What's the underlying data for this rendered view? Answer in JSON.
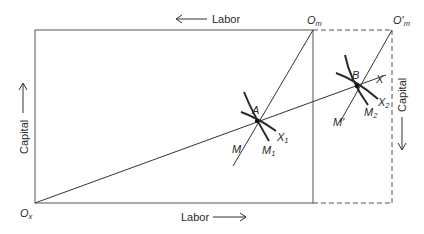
{
  "figure": {
    "type": "Edgeworth box diagram (factor allocation, expanded box)",
    "colors": {
      "line": "#555555",
      "curve": "#2a2a2a",
      "text": "#2a2a2a",
      "background": "#ffffff"
    }
  },
  "axes": {
    "top_label": "Labor",
    "bottom_label": "Labor",
    "left_label": "Capital",
    "right_label": "Capital",
    "top_arrow": "left",
    "bottom_arrow": "right",
    "left_arrow": "up",
    "right_arrow": "down"
  },
  "origins": {
    "ox": {
      "base": "O",
      "sub": "x"
    },
    "om": {
      "base": "O",
      "sub": "m"
    },
    "om_prime": {
      "base": "O′",
      "sub": "m"
    }
  },
  "points": {
    "a": "A",
    "b": "B"
  },
  "rays": {
    "x": "X",
    "m": "M",
    "m_prime": "M′"
  },
  "isoquants": {
    "x1": {
      "base": "X",
      "sub": "1"
    },
    "x2": {
      "base": "X",
      "sub": "2"
    },
    "m1": {
      "base": "M",
      "sub": "1"
    },
    "m2": {
      "base": "M",
      "sub": "2"
    }
  }
}
